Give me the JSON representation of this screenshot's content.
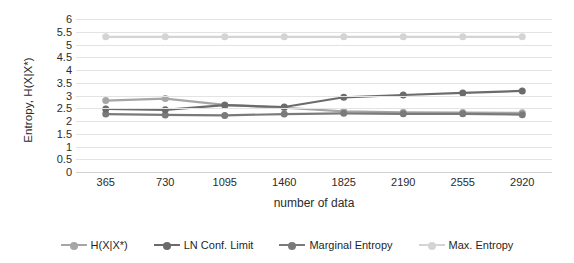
{
  "chart_data": {
    "type": "line",
    "title": "",
    "xlabel": "number of data",
    "ylabel": "Entropy, H(X|X*)",
    "categories": [
      "365",
      "730",
      "1095",
      "1460",
      "1825",
      "2190",
      "2555",
      "2920"
    ],
    "ylim": [
      0,
      6
    ],
    "yticks": [
      "0",
      "0.5",
      "1",
      "1.5",
      "2",
      "2.5",
      "3",
      "3.5",
      "4",
      "4.5",
      "5",
      "5.5",
      "6"
    ],
    "grid": true,
    "legend_position": "bottom",
    "series": [
      {
        "name": "H(X|X*)",
        "color": "#a6a6a6",
        "values": [
          2.8,
          2.88,
          2.63,
          2.52,
          2.38,
          2.34,
          2.33,
          2.32
        ]
      },
      {
        "name": "LN Conf. Limit",
        "color": "#6b6b6b",
        "values": [
          2.47,
          2.44,
          2.62,
          2.55,
          2.93,
          3.02,
          3.1,
          3.18
        ]
      },
      {
        "name": "Marginal Entropy",
        "color": "#7a7a7a",
        "values": [
          2.27,
          2.24,
          2.22,
          2.27,
          2.3,
          2.28,
          2.28,
          2.25
        ]
      },
      {
        "name": "Max. Entropy",
        "color": "#d4d4d4",
        "values": [
          5.3,
          5.3,
          5.3,
          5.3,
          5.3,
          5.3,
          5.3,
          5.3
        ]
      }
    ]
  },
  "legend": {
    "items": [
      {
        "label": "H(X|X*)"
      },
      {
        "label": "LN Conf. Limit"
      },
      {
        "label": "Marginal Entropy"
      },
      {
        "label": "Max. Entropy"
      }
    ]
  }
}
